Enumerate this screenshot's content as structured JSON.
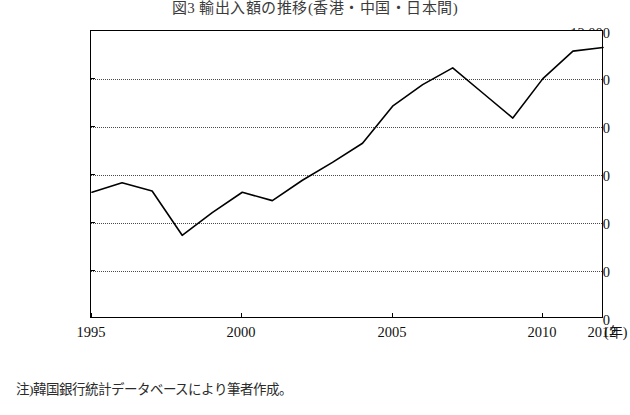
{
  "figure": {
    "title": "図3 輸出入額の推移(香港・中国・日本間)",
    "source_note": "注)韓国銀行統計データベースにより筆者作成。",
    "x_unit_label": "(年)"
  },
  "chart_data": {
    "type": "line",
    "title": "図3 輸出入額の推移(香港・中国・日本間)",
    "xlabel": "(年)",
    "ylabel": "",
    "xlim": [
      1995,
      2012
    ],
    "ylim": [
      0,
      12000
    ],
    "xticks": [
      1995,
      2000,
      2005,
      2010,
      2012
    ],
    "yticks": [
      0,
      2000,
      4000,
      6000,
      8000,
      10000,
      12000
    ],
    "ytick_labels": [
      "0",
      "2,000",
      "4,000",
      "6,000",
      "8,000",
      "10,000",
      "12,000"
    ],
    "grid": "horizontal-dotted",
    "legend": "none",
    "series": [
      {
        "name": "輸出入額",
        "x": [
          1995,
          1996,
          1997,
          1998,
          1999,
          2000,
          2001,
          2002,
          2003,
          2004,
          2005,
          2006,
          2007,
          2008,
          2009,
          2010,
          2011,
          2012
        ],
        "values": [
          5300,
          5700,
          5350,
          3500,
          4450,
          5300,
          4950,
          5800,
          6550,
          7350,
          8900,
          9800,
          10500,
          9450,
          8400,
          10050,
          11200,
          11350
        ]
      }
    ]
  }
}
